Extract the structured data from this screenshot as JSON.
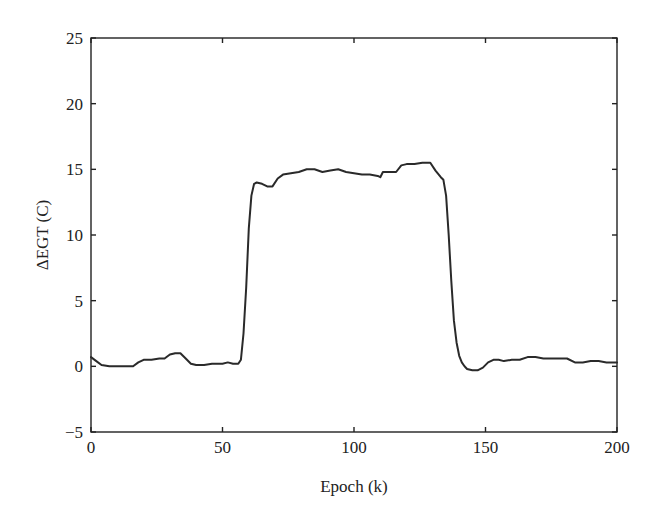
{
  "chart_data": {
    "type": "line",
    "title": "",
    "xlabel": "Epoch (k)",
    "ylabel": "ΔEGT (C)",
    "xlim": [
      0,
      200
    ],
    "ylim": [
      -5,
      25
    ],
    "xticks": [
      0,
      50,
      100,
      150,
      200
    ],
    "yticks": [
      -5,
      0,
      5,
      10,
      15,
      20,
      25
    ],
    "xtick_labels": [
      "0",
      "50",
      "100",
      "150",
      "200"
    ],
    "ytick_labels": [
      "−5",
      "0",
      "5",
      "10",
      "15",
      "20",
      "25"
    ],
    "grid": false,
    "legend": null,
    "line_color": "#2a2a2a",
    "series": [
      {
        "name": "ΔEGT",
        "x": [
          0,
          2,
          4,
          7,
          10,
          13,
          16,
          18,
          20,
          23,
          26,
          28,
          30,
          32,
          34,
          36,
          38,
          40,
          43,
          46,
          50,
          52,
          54,
          56,
          57,
          58,
          59,
          60,
          61,
          62,
          63,
          65,
          67,
          69,
          71,
          73,
          76,
          79,
          82,
          85,
          88,
          91,
          94,
          97,
          100,
          103,
          106,
          109,
          110,
          111,
          113,
          116,
          118,
          120,
          123,
          126,
          129,
          131,
          133,
          134,
          135,
          136,
          137,
          138,
          139,
          140,
          141,
          142,
          143,
          145,
          147,
          149,
          151,
          153,
          155,
          157,
          160,
          163,
          166,
          169,
          172,
          175,
          178,
          181,
          184,
          187,
          190,
          193,
          196,
          200
        ],
        "y": [
          0.7,
          0.4,
          0.1,
          0.0,
          0.0,
          0.0,
          0.0,
          0.3,
          0.5,
          0.5,
          0.6,
          0.6,
          0.9,
          1.0,
          1.0,
          0.6,
          0.2,
          0.1,
          0.1,
          0.2,
          0.2,
          0.3,
          0.2,
          0.2,
          0.5,
          2.5,
          6.0,
          10.5,
          13.0,
          13.9,
          14.0,
          13.9,
          13.7,
          13.7,
          14.3,
          14.6,
          14.7,
          14.8,
          15.0,
          15.0,
          14.8,
          14.9,
          15.0,
          14.8,
          14.7,
          14.6,
          14.6,
          14.5,
          14.4,
          14.8,
          14.8,
          14.8,
          15.3,
          15.4,
          15.4,
          15.5,
          15.5,
          14.9,
          14.4,
          14.2,
          13.0,
          10.0,
          6.5,
          3.5,
          1.8,
          0.8,
          0.3,
          0.0,
          -0.2,
          -0.3,
          -0.3,
          -0.1,
          0.3,
          0.5,
          0.5,
          0.4,
          0.5,
          0.5,
          0.7,
          0.7,
          0.6,
          0.6,
          0.6,
          0.6,
          0.3,
          0.3,
          0.4,
          0.4,
          0.3,
          0.3
        ]
      }
    ]
  }
}
